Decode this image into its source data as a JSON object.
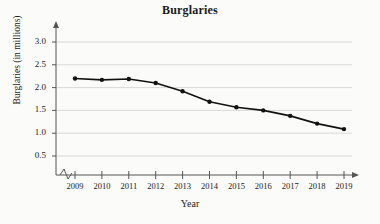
{
  "chart_data": {
    "type": "line",
    "title": "Burglaries",
    "xlabel": "Year",
    "ylabel": "Burglaries (in millions)",
    "categories": [
      "2009",
      "2010",
      "2011",
      "2012",
      "2013",
      "2014",
      "2015",
      "2016",
      "2017",
      "2018",
      "2019"
    ],
    "values": [
      2.2,
      2.17,
      2.19,
      2.1,
      1.92,
      1.69,
      1.57,
      1.5,
      1.38,
      1.21,
      1.09
    ],
    "ylim": [
      0,
      3.25
    ],
    "yticks": [
      "0.5",
      "1.0",
      "1.5",
      "2.0",
      "2.5",
      "3.0"
    ],
    "ytick_values": [
      0.5,
      1.0,
      1.5,
      2.0,
      2.5,
      3.0
    ],
    "grid": "horizontal",
    "legend": "none",
    "marker": "filled-circle",
    "line_color": "#111111",
    "grid_color": "#cfcfcf",
    "axis_color": "#555555",
    "x_axis_break": true
  },
  "axes": {
    "y_arrow": "up-arrow-icon",
    "x_arrow": "right-arrow-icon",
    "break_symbol": "axis-break-zigzag-icon"
  }
}
